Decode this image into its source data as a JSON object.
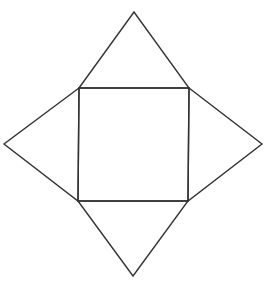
{
  "diagram": {
    "type": "net-of-square-pyramid",
    "stroke_color": "#333333",
    "background": "#ffffff",
    "square": {
      "points": [
        [
          79,
          88
        ],
        [
          189,
          88
        ],
        [
          188,
          201
        ],
        [
          78,
          201
        ]
      ]
    },
    "triangles": {
      "top": {
        "points": [
          [
            79,
            88
          ],
          [
            134,
            12
          ],
          [
            189,
            88
          ]
        ]
      },
      "left": {
        "points": [
          [
            79,
            88
          ],
          [
            4,
            144
          ],
          [
            78,
            201
          ]
        ]
      },
      "right": {
        "points": [
          [
            189,
            88
          ],
          [
            262,
            144
          ],
          [
            188,
            201
          ]
        ]
      },
      "bottom": {
        "points": [
          [
            78,
            201
          ],
          [
            133,
            276
          ],
          [
            188,
            201
          ]
        ]
      }
    }
  }
}
